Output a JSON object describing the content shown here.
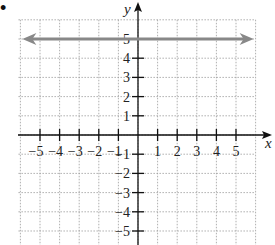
{
  "bullet": "•",
  "chart_data": {
    "type": "line",
    "title": "",
    "xlabel": "x",
    "ylabel": "y",
    "xlim": [
      -6,
      6
    ],
    "ylim": [
      -6,
      6
    ],
    "grid": true,
    "x_ticks": [
      -5,
      -4,
      -3,
      -2,
      -1,
      1,
      2,
      3,
      4,
      5
    ],
    "y_ticks": [
      -5,
      -4,
      -3,
      -2,
      -1,
      1,
      2,
      3,
      4,
      5
    ],
    "x_tick_labels": [
      "−5",
      "−4",
      "−3",
      "−2",
      "−1",
      "1",
      "2",
      "3",
      "4",
      "5"
    ],
    "y_tick_labels": [
      "5",
      "4",
      "3",
      "2",
      "1",
      "−1",
      "−2",
      "−3",
      "−4",
      "−5"
    ],
    "series": [
      {
        "name": "y = 5",
        "type": "horizontal-line",
        "equation": "y = 5",
        "x": [
          -5.9,
          5.9
        ],
        "y": [
          5,
          5
        ],
        "arrows": "both",
        "color": "#888888"
      }
    ]
  },
  "colors": {
    "axis": "#111111",
    "grid": "#9a9a9a",
    "line": "#8a8a8a"
  }
}
